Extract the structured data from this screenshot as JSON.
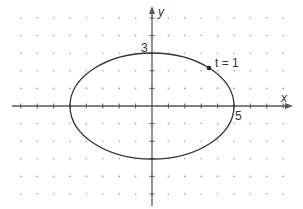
{
  "figure": {
    "type": "parametric-ellipse",
    "axes": {
      "x_label": "x",
      "y_label": "y"
    },
    "labels": {
      "y_intercept": "3",
      "x_intercept": "5",
      "point_label": "t = 1"
    },
    "ellipse": {
      "semi_major_x": 5,
      "semi_minor_y": 3,
      "center": [
        0,
        0
      ]
    },
    "point": {
      "t": 1,
      "x": 2.7,
      "y": 2.52
    },
    "grid": {
      "style": "dotted",
      "x_range": [
        -8,
        8
      ],
      "y_range": [
        -5,
        5
      ]
    },
    "colors": {
      "curve": "#333333",
      "axis": "#555555",
      "dots": "#999999"
    }
  }
}
